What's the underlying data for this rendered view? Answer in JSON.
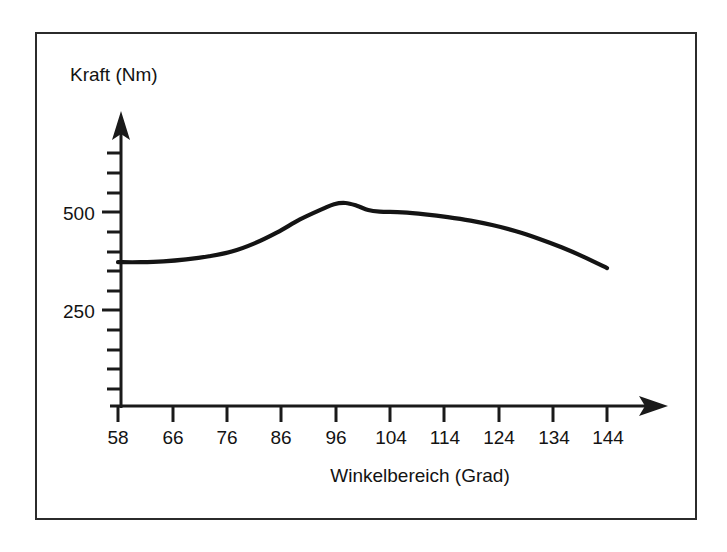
{
  "figure": {
    "border_color": "#2b2b2b",
    "background": "#ffffff",
    "curve_color": "#141414",
    "axis_color": "#1a1a1a"
  },
  "labels": {
    "y_axis_title": "Kraft (Nm)",
    "x_axis_title": "Winkelbereich (Grad)"
  },
  "axes": {
    "y_tick_labels": [
      "500",
      "250"
    ],
    "x_tick_labels": [
      "58",
      "66",
      "76",
      "86",
      "96",
      "104",
      "114",
      "124",
      "134",
      "144"
    ]
  },
  "chart_data": {
    "type": "line",
    "title": "",
    "xlabel": "Winkelbereich (Grad)",
    "ylabel": "Kraft (Nm)",
    "xlim": [
      58,
      144
    ],
    "ylim": [
      0,
      625
    ],
    "grid": false,
    "legend": null,
    "x_ticks": [
      58,
      66,
      76,
      86,
      96,
      104,
      114,
      124,
      134,
      144
    ],
    "x_tick_labels": [
      "58",
      "66",
      "76",
      "86",
      "96",
      "104",
      "114",
      "124",
      "134",
      "144"
    ],
    "y_ticks": [
      250,
      500
    ],
    "y_tick_labels": [
      "250",
      "500"
    ],
    "y_minor_tick_step": 50,
    "series": [
      {
        "name": "Kraft",
        "x": [
          58,
          62,
          66,
          70,
          74,
          78,
          82,
          86,
          90,
          94,
          96,
          98,
          100,
          102,
          104,
          108,
          112,
          116,
          120,
          124,
          128,
          132,
          136,
          140,
          144
        ],
        "values": [
          372,
          372,
          374,
          379,
          387,
          399,
          420,
          448,
          481,
          508,
          520,
          523,
          516,
          505,
          501,
          499,
          494,
          487,
          478,
          466,
          451,
          432,
          410,
          385,
          357
        ]
      }
    ],
    "annotations": [
      {
        "text": "peak",
        "x": 97,
        "y": 523
      }
    ]
  }
}
